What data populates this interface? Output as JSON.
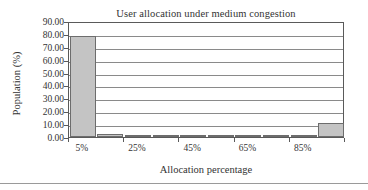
{
  "chart_data": {
    "type": "bar",
    "title": "User allocation under medium congestion",
    "xlabel": "Allocation percentage",
    "ylabel": "Population (%)",
    "ylim": [
      0,
      90
    ],
    "ytick_labels": [
      "0.00",
      "10.00",
      "20.00",
      "30.00",
      "40.00",
      "50.00",
      "60.00",
      "70.00",
      "80.00",
      "90.00"
    ],
    "ytick_values": [
      0,
      10,
      20,
      30,
      40,
      50,
      60,
      70,
      80,
      90
    ],
    "xtick_labels": [
      "5%",
      "25%",
      "45%",
      "65%",
      "85%"
    ],
    "xtick_values": [
      5,
      25,
      45,
      65,
      85
    ],
    "categories": [
      "5%",
      "15%",
      "25%",
      "35%",
      "45%",
      "55%",
      "65%",
      "75%",
      "85%",
      "95%"
    ],
    "values": [
      78.0,
      2.6,
      0.3,
      0.3,
      0.6,
      0.6,
      0.9,
      1.3,
      0.2,
      11.0
    ],
    "grid": "horizontal",
    "legend": "none",
    "bar_fill": "#c4c4c4",
    "bar_edge": "#6d6d6d",
    "axis_color": "#5a5a5a",
    "grid_color": "#8a8a8a"
  }
}
